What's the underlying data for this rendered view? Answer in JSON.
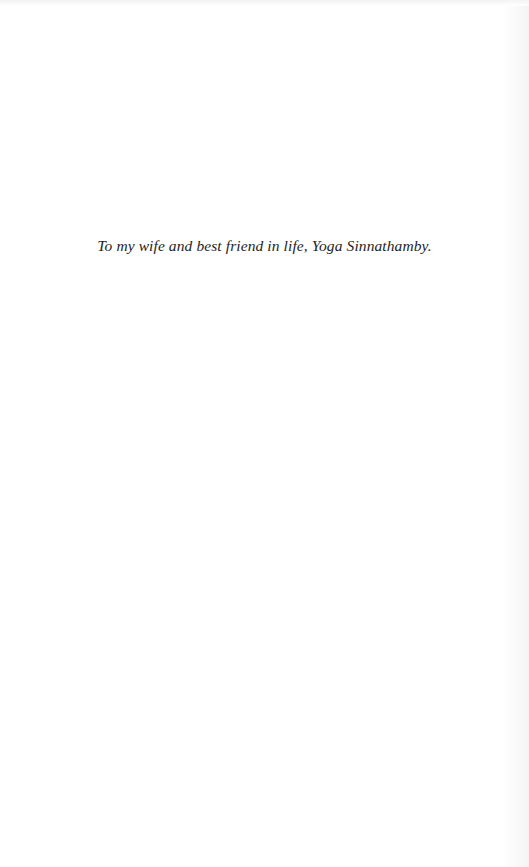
{
  "page": {
    "type": "dedication",
    "dedication_text": "To my wife and best friend in life, Yoga Sinnathamby."
  }
}
